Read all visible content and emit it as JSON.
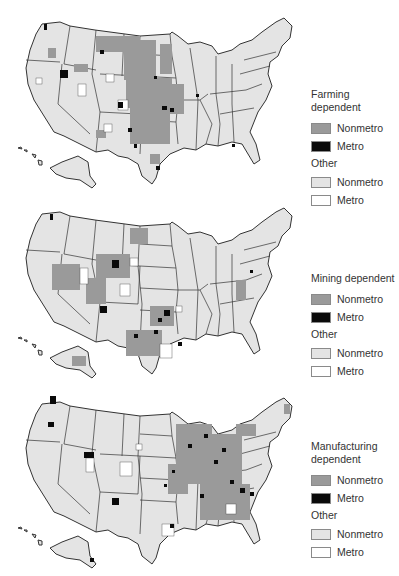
{
  "colors": {
    "nonmetro_dependent": "#9a9a9a",
    "metro_dependent": "#0a0a0a",
    "other_nonmetro": "#e4e4e4",
    "other_metro": "#ffffff",
    "borders": "#333333"
  },
  "panels": [
    {
      "map_label": "Farming dependent counties map",
      "legend": {
        "title": "Farming dependent",
        "items": [
          {
            "label": "Nonmetro",
            "swatch": "nonmetro_dependent"
          },
          {
            "label": "Metro",
            "swatch": "metro_dependent"
          }
        ],
        "other_title": "Other",
        "other_items": [
          {
            "label": "Nonmetro",
            "swatch": "other_nonmetro"
          },
          {
            "label": "Metro",
            "swatch": "other_metro"
          }
        ]
      }
    },
    {
      "map_label": "Mining dependent counties map",
      "legend": {
        "title": "Mining dependent",
        "items": [
          {
            "label": "Nonmetro",
            "swatch": "nonmetro_dependent"
          },
          {
            "label": "Metro",
            "swatch": "metro_dependent"
          }
        ],
        "other_title": "Other",
        "other_items": [
          {
            "label": "Nonmetro",
            "swatch": "other_nonmetro"
          },
          {
            "label": "Metro",
            "swatch": "other_metro"
          }
        ]
      }
    },
    {
      "map_label": "Manufacturing dependent counties map",
      "legend": {
        "title": "Manufacturing dependent",
        "items": [
          {
            "label": "Nonmetro",
            "swatch": "nonmetro_dependent"
          },
          {
            "label": "Metro",
            "swatch": "metro_dependent"
          }
        ],
        "other_title": "Other",
        "other_items": [
          {
            "label": "Nonmetro",
            "swatch": "other_nonmetro"
          },
          {
            "label": "Metro",
            "swatch": "other_metro"
          }
        ]
      }
    }
  ]
}
